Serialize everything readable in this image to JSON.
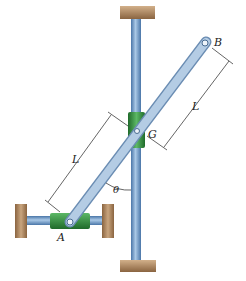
{
  "labels": {
    "A": "A",
    "B": "B",
    "G": "G",
    "L_upper": "L",
    "L_lower": "L",
    "theta": "θ"
  },
  "colors": {
    "rod": "#7fa7cf",
    "rod_dark": "#4a76a8",
    "collar": "#3f9a4a",
    "collar_dark": "#1f6a2a",
    "block": "#b8916a",
    "block_dark": "#8a6440",
    "bar": "#a9c3de",
    "bar_edge": "#6b8db3"
  }
}
